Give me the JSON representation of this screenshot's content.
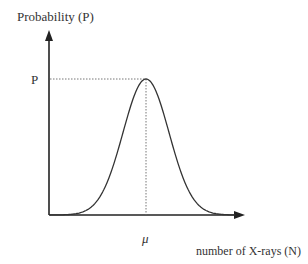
{
  "chart_data": {
    "type": "line",
    "title": "",
    "xlabel": "number of X-rays (N)",
    "ylabel": "Probability (P)",
    "peak_label_y": "P",
    "peak_label_x": "μ",
    "curve": "gaussian (normal distribution) centered at μ with peak probability P",
    "grid": false,
    "legend": null
  },
  "labels": {
    "y_axis": "Probability (P)",
    "x_axis": "number of X-rays (N)",
    "peak_y": "P",
    "peak_x": "μ"
  },
  "colors": {
    "axis": "#222222",
    "curve": "#333333",
    "guide": "#555555"
  }
}
